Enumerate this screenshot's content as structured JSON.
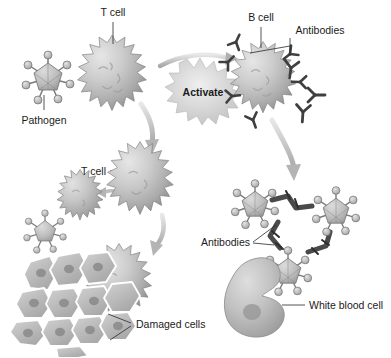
{
  "diagram": {
    "background_color": "#ffffff",
    "labels": {
      "t_cell_top": "T cell",
      "pathogen": "Pathogen",
      "activate": "Activate",
      "b_cell": "B cell",
      "antibodies_top": "Antibodies",
      "t_cell_mid": "T cell",
      "damaged_cells": "Damaged cells",
      "antibodies_bottom": "Antibodies",
      "white_blood_cell": "White blood cell"
    },
    "colors": {
      "cell_light": "#d8d8d8",
      "cell_mid": "#b4b4b4",
      "cell_dark": "#8e8e8e",
      "outline": "#6f6f6f",
      "antibody": "#4a4a4a",
      "arrow": "#b9b9b9",
      "text": "#1b1b1b",
      "nucleus": "#8a8a8a",
      "starburst": "#cfcfcf"
    },
    "elements": {
      "t_cell_top": {
        "cx": 112,
        "cy": 75,
        "r": 40,
        "spikes": 16
      },
      "pathogen_top": {
        "cx": 48,
        "cy": 78,
        "r": 15,
        "spikes": 7
      },
      "b_cell": {
        "cx": 263,
        "cy": 80,
        "r": 38,
        "spikes": 16
      },
      "t_cell_mid": {
        "cx": 78,
        "cy": 198,
        "r": 26,
        "spikes": 13
      },
      "pathogen_mid": {
        "cx": 43,
        "cy": 232,
        "r": 13,
        "spikes": 7
      },
      "t_cell_big": {
        "cx": 137,
        "cy": 183,
        "r": 38,
        "spikes": 16
      },
      "t_cell_lower": {
        "cx": 117,
        "cy": 284,
        "r": 37,
        "spikes": 16
      },
      "white_blood_cell": {
        "cx": 265,
        "cy": 305,
        "rx": 38,
        "ry": 32
      },
      "free_antibodies": 3,
      "complex_pathogens": 3,
      "damaged_cells_count": 12
    }
  }
}
